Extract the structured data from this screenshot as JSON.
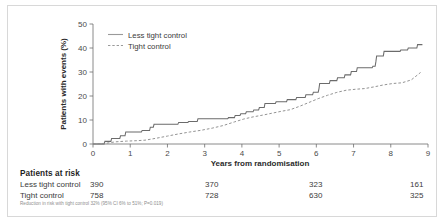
{
  "chart_data": {
    "type": "line",
    "title": "",
    "xlabel": "Years from randomisation",
    "ylabel": "Patients with events (%)",
    "xlim": [
      0,
      9
    ],
    "ylim": [
      0,
      50
    ],
    "xticks": [
      "0",
      "1",
      "2",
      "3",
      "4",
      "5",
      "6",
      "7",
      "8",
      "9"
    ],
    "yticks": [
      "0",
      "10",
      "20",
      "30",
      "40",
      "50"
    ],
    "grid": false,
    "legend_position": "top-left",
    "series": [
      {
        "name": "Less tight control",
        "style": "solid",
        "color": "#6b6b6b",
        "points": [
          [
            0.0,
            0.0
          ],
          [
            0.3,
            0.0
          ],
          [
            0.32,
            1.1
          ],
          [
            0.48,
            1.1
          ],
          [
            0.5,
            2.3
          ],
          [
            0.72,
            2.3
          ],
          [
            0.74,
            3.4
          ],
          [
            0.86,
            3.4
          ],
          [
            0.88,
            5.0
          ],
          [
            1.3,
            5.0
          ],
          [
            1.32,
            5.6
          ],
          [
            1.52,
            5.6
          ],
          [
            1.54,
            7.0
          ],
          [
            1.62,
            7.0
          ],
          [
            1.64,
            8.2
          ],
          [
            2.28,
            8.2
          ],
          [
            2.3,
            9.0
          ],
          [
            2.55,
            9.0
          ],
          [
            2.57,
            9.4
          ],
          [
            2.8,
            9.4
          ],
          [
            2.82,
            10.5
          ],
          [
            3.62,
            10.5
          ],
          [
            3.64,
            11.0
          ],
          [
            3.8,
            11.0
          ],
          [
            3.82,
            11.9
          ],
          [
            3.95,
            11.9
          ],
          [
            3.97,
            12.6
          ],
          [
            4.1,
            12.6
          ],
          [
            4.12,
            13.4
          ],
          [
            4.3,
            13.4
          ],
          [
            4.32,
            14.2
          ],
          [
            4.45,
            14.2
          ],
          [
            4.47,
            15.2
          ],
          [
            4.6,
            15.2
          ],
          [
            4.62,
            16.9
          ],
          [
            4.9,
            16.9
          ],
          [
            4.92,
            17.6
          ],
          [
            5.2,
            17.6
          ],
          [
            5.22,
            18.5
          ],
          [
            5.45,
            18.5
          ],
          [
            5.47,
            19.4
          ],
          [
            5.7,
            19.4
          ],
          [
            5.72,
            20.5
          ],
          [
            5.9,
            20.5
          ],
          [
            5.92,
            21.6
          ],
          [
            6.05,
            21.6
          ],
          [
            6.07,
            23.0
          ],
          [
            6.09,
            25.2
          ],
          [
            6.35,
            25.2
          ],
          [
            6.37,
            26.4
          ],
          [
            6.55,
            26.4
          ],
          [
            6.57,
            27.6
          ],
          [
            6.75,
            27.6
          ],
          [
            6.77,
            28.8
          ],
          [
            6.92,
            28.8
          ],
          [
            6.94,
            30.2
          ],
          [
            7.08,
            30.2
          ],
          [
            7.1,
            31.8
          ],
          [
            7.5,
            31.8
          ],
          [
            7.52,
            32.4
          ],
          [
            7.58,
            32.4
          ],
          [
            7.6,
            34.3
          ],
          [
            7.62,
            36.7
          ],
          [
            7.8,
            36.7
          ],
          [
            7.82,
            38.6
          ],
          [
            8.25,
            38.6
          ],
          [
            8.27,
            39.2
          ],
          [
            8.45,
            39.2
          ],
          [
            8.47,
            40.0
          ],
          [
            8.7,
            40.0
          ],
          [
            8.72,
            41.4
          ],
          [
            8.85,
            41.4
          ]
        ]
      },
      {
        "name": "Tight control",
        "style": "dashed",
        "color": "#8d8d8d",
        "points": [
          [
            0.0,
            0.0
          ],
          [
            0.35,
            0.3
          ],
          [
            0.6,
            0.9
          ],
          [
            0.9,
            1.2
          ],
          [
            1.2,
            1.4
          ],
          [
            1.4,
            1.6
          ],
          [
            1.7,
            2.4
          ],
          [
            2.0,
            3.3
          ],
          [
            2.3,
            4.2
          ],
          [
            2.6,
            5.0
          ],
          [
            2.9,
            5.7
          ],
          [
            3.2,
            6.6
          ],
          [
            3.5,
            7.7
          ],
          [
            3.8,
            9.2
          ],
          [
            4.05,
            10.4
          ],
          [
            4.3,
            11.3
          ],
          [
            4.55,
            12.0
          ],
          [
            4.8,
            12.8
          ],
          [
            5.05,
            13.6
          ],
          [
            5.3,
            14.3
          ],
          [
            5.55,
            15.7
          ],
          [
            5.8,
            17.3
          ],
          [
            6.05,
            18.9
          ],
          [
            6.3,
            20.3
          ],
          [
            6.55,
            21.5
          ],
          [
            6.8,
            22.4
          ],
          [
            7.05,
            22.8
          ],
          [
            7.3,
            23.1
          ],
          [
            7.55,
            23.8
          ],
          [
            7.8,
            24.6
          ],
          [
            8.05,
            25.2
          ],
          [
            8.3,
            25.5
          ],
          [
            8.55,
            26.7
          ],
          [
            8.8,
            29.8
          ]
        ]
      }
    ]
  },
  "legend": {
    "items": [
      {
        "label": "Less tight control",
        "style": "solid"
      },
      {
        "label": "Tight control",
        "style": "dashed"
      }
    ]
  },
  "risk_table": {
    "title": "Patients at risk",
    "rows": [
      {
        "label": "Less tight control",
        "values": [
          "390",
          "370",
          "323",
          "161"
        ]
      },
      {
        "label": "Tight control",
        "values": [
          "758",
          "728",
          "630",
          "325"
        ]
      }
    ]
  },
  "footnote": "Reduction in risk with tight control 32% (95% CI 6% to 51%; P=0.019)"
}
